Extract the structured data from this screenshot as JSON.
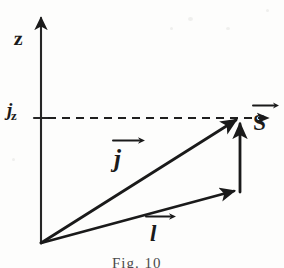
{
  "figure": {
    "caption": "Fig. 10",
    "background_color": "#fdfdfc",
    "ink_color": "#1a1a1a",
    "labels": {
      "axis_z": "z",
      "projection_jz_base": "j",
      "projection_jz_sub": "z",
      "vector_j": "j",
      "vector_l": "l",
      "vector_s": "S"
    },
    "icons": {
      "axis_arrow": "arrow-up-icon",
      "j_arrowhead": "arrow-diagonal-icon",
      "l_arrowhead": "arrow-right-icon",
      "s_arrowhead": "arrow-up-icon",
      "overhead_arrow": "vector-overarrow-icon",
      "dashed_projection": "dashed-line-icon"
    },
    "geometry": {
      "origin": [
        41,
        243
      ],
      "axis_tip": [
        41,
        14
      ],
      "j_tip": [
        240,
        118
      ],
      "l_tip": [
        238,
        192
      ],
      "jz_tick": [
        41,
        118
      ],
      "dashed_line_y": 118,
      "dashed_line_x_start": 48,
      "dashed_line_x_end": 232
    }
  }
}
